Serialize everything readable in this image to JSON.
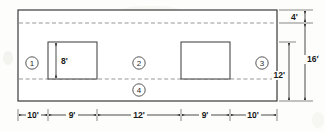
{
  "drawing": {
    "title": "Floor plan dimension diagram",
    "units": "feet",
    "outer_rect": {
      "x": 18,
      "y": 10,
      "width": 259,
      "height": 91
    },
    "dashed_lines": [
      {
        "name": "upper-offset-line",
        "y": 23,
        "x1": 19,
        "x2": 276
      },
      {
        "name": "lower-offset-line",
        "y": 79,
        "x1": 19,
        "x2": 276
      }
    ],
    "inner_rects": [
      {
        "name": "left-inner-rect",
        "x": 48,
        "y": 42,
        "width": 49,
        "height": 37,
        "label": "8'"
      },
      {
        "name": "right-inner-rect",
        "x": 181,
        "y": 42,
        "width": 49,
        "height": 37,
        "label": ""
      }
    ],
    "zone_markers": [
      {
        "id": "1",
        "label": "1",
        "cx": 32,
        "cy": 63
      },
      {
        "id": "2",
        "label": "2",
        "cx": 139,
        "cy": 63
      },
      {
        "id": "3",
        "label": "3",
        "cx": 262,
        "cy": 63
      },
      {
        "id": "4",
        "label": "4",
        "cx": 139,
        "cy": 90
      }
    ],
    "vertical_dimensions": [
      {
        "name": "dim-4ft",
        "label": "4'",
        "y1": 10,
        "y2": 23,
        "x": 305,
        "text_x": 292,
        "text_y": 20
      },
      {
        "name": "dim-16ft",
        "label": "16'",
        "y1": 23,
        "y2": 101,
        "x": 305,
        "text_x": 308,
        "text_y": 60
      },
      {
        "name": "dim-12ft",
        "label": "12'",
        "y1": 42,
        "y2": 101,
        "x": 289,
        "text_x": 286,
        "text_y": 75
      }
    ],
    "horizontal_dimensions": {
      "line_y": 115,
      "segments": [
        {
          "name": "dim-10ft-left",
          "label": "10'",
          "x1": 18,
          "x2": 48
        },
        {
          "name": "dim-9ft-left",
          "label": "9'",
          "x1": 48,
          "x2": 97
        },
        {
          "name": "dim-12ft-center",
          "label": "12'",
          "x1": 97,
          "x2": 181
        },
        {
          "name": "dim-9ft-right",
          "label": "9'",
          "x1": 181,
          "x2": 230
        },
        {
          "name": "dim-10ft-right",
          "label": "10'",
          "x1": 230,
          "x2": 277
        }
      ]
    },
    "inner_vertical_dimension": {
      "name": "dim-8ft-inner",
      "label": "8'",
      "x": 56,
      "y1": 42,
      "y2": 79,
      "text_x": 61,
      "text_y": 64
    },
    "colors": {
      "line": "#3a3a3a",
      "dashed": "#8a8a8a",
      "text": "#1a1a1a",
      "background": "#fdfdfb"
    }
  }
}
